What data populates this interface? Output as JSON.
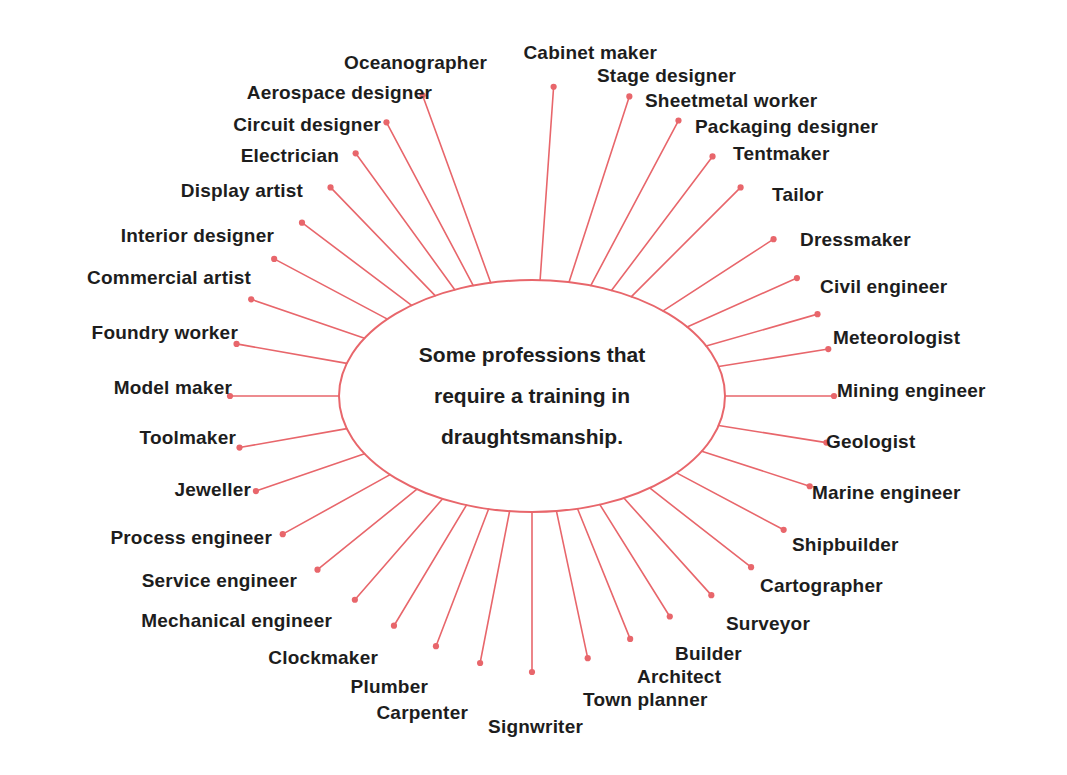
{
  "diagram": {
    "type": "radial-spoke-diagram",
    "title_lines": [
      "Some professions that",
      "require a training in",
      "draughtsmanship."
    ],
    "center_label": "Some professions that require a training in draughtsmanship.",
    "colors": {
      "spoke": "#e8666b",
      "ellipse": "#e8666b",
      "dot": "#e8666b",
      "text": "#1d1d1d",
      "background": "#ffffff"
    },
    "ellipse": {
      "cx": 532,
      "cy": 396,
      "rx": 193,
      "ry": 116
    },
    "spoke_count": 32,
    "nodes": [
      {
        "label": "Cabinet maker",
        "angle": -86,
        "r": 310,
        "side": "left",
        "lx": 657,
        "ly": 52
      },
      {
        "label": "Stage designer",
        "angle": -72,
        "r": 315,
        "side": "right",
        "lx": 597,
        "ly": 75
      },
      {
        "label": "Sheetmetal worker",
        "angle": -62,
        "r": 312,
        "side": "right",
        "lx": 645,
        "ly": 100
      },
      {
        "label": "Packaging designer",
        "angle": -53,
        "r": 300,
        "side": "right",
        "lx": 695,
        "ly": 126
      },
      {
        "label": "Tentmaker",
        "angle": -45,
        "r": 295,
        "side": "right",
        "lx": 733,
        "ly": 153
      },
      {
        "label": "Tailor",
        "angle": -33,
        "r": 288,
        "side": "right",
        "lx": 772,
        "ly": 194
      },
      {
        "label": "Dressmaker",
        "angle": -24,
        "r": 290,
        "side": "right",
        "lx": 800,
        "ly": 239
      },
      {
        "label": "Civil engineer",
        "angle": -16,
        "r": 297,
        "side": "right",
        "lx": 820,
        "ly": 286
      },
      {
        "label": "Meteorologist",
        "angle": -9,
        "r": 300,
        "side": "right",
        "lx": 833,
        "ly": 337
      },
      {
        "label": "Mining engineer",
        "angle": 0,
        "r": 302,
        "side": "right",
        "lx": 837,
        "ly": 390
      },
      {
        "label": "Geologist",
        "angle": 9,
        "r": 298,
        "side": "right",
        "lx": 826,
        "ly": 441
      },
      {
        "label": "Marine engineer",
        "angle": 18,
        "r": 292,
        "side": "right",
        "lx": 812,
        "ly": 492
      },
      {
        "label": "Shipbuilder",
        "angle": 28,
        "r": 285,
        "side": "right",
        "lx": 792,
        "ly": 544
      },
      {
        "label": "Cartographer",
        "angle": 38,
        "r": 278,
        "side": "right",
        "lx": 760,
        "ly": 585
      },
      {
        "label": "Surveyor",
        "angle": 48,
        "r": 268,
        "side": "right",
        "lx": 726,
        "ly": 623
      },
      {
        "label": "Builder",
        "angle": 58,
        "r": 260,
        "side": "right",
        "lx": 675,
        "ly": 653
      },
      {
        "label": "Architect",
        "angle": 68,
        "r": 262,
        "side": "right",
        "lx": 637,
        "ly": 676
      },
      {
        "label": "Town planner",
        "angle": 78,
        "r": 268,
        "side": "right",
        "lx": 583,
        "ly": 699
      },
      {
        "label": "Signwriter",
        "angle": 90,
        "r": 276,
        "side": "left",
        "lx": 583,
        "ly": 726
      },
      {
        "label": "Carpenter",
        "angle": 101,
        "r": 272,
        "side": "left",
        "lx": 468,
        "ly": 712
      },
      {
        "label": "Plumber",
        "angle": 111,
        "r": 268,
        "side": "left",
        "lx": 428,
        "ly": 686
      },
      {
        "label": "Clockmaker",
        "angle": 121,
        "r": 268,
        "side": "left",
        "lx": 378,
        "ly": 657
      },
      {
        "label": "Mechanical engineer",
        "angle": 131,
        "r": 270,
        "side": "left",
        "lx": 332,
        "ly": 620
      },
      {
        "label": "Service engineer",
        "angle": 141,
        "r": 276,
        "side": "left",
        "lx": 297,
        "ly": 580
      },
      {
        "label": "Process engineer",
        "angle": 151,
        "r": 285,
        "side": "left",
        "lx": 272,
        "ly": 537
      },
      {
        "label": "Jeweller",
        "angle": 161,
        "r": 292,
        "side": "left",
        "lx": 251,
        "ly": 489
      },
      {
        "label": "Toolmaker",
        "angle": 170,
        "r": 297,
        "side": "left",
        "lx": 236,
        "ly": 437
      },
      {
        "label": "Model maker",
        "angle": 180,
        "r": 302,
        "side": "left",
        "lx": 232,
        "ly": 387
      },
      {
        "label": "Foundry worker",
        "angle": 190,
        "r": 300,
        "side": "left",
        "lx": 238,
        "ly": 332
      },
      {
        "label": "Commercial artist",
        "angle": 199,
        "r": 297,
        "side": "left",
        "lx": 251,
        "ly": 277
      },
      {
        "label": "Interior designer",
        "angle": 208,
        "r": 292,
        "side": "left",
        "lx": 274,
        "ly": 235
      },
      {
        "label": "Display artist",
        "angle": 217,
        "r": 288,
        "side": "left",
        "lx": 303,
        "ly": 190
      },
      {
        "label": "Electrician",
        "angle": 226,
        "r": 290,
        "side": "left",
        "lx": 339,
        "ly": 155
      },
      {
        "label": "Circuit designer",
        "angle": 234,
        "r": 300,
        "side": "left",
        "lx": 381,
        "ly": 124
      },
      {
        "label": "Aerospace designer",
        "angle": 242,
        "r": 310,
        "side": "left",
        "lx": 432,
        "ly": 92
      },
      {
        "label": "Oceanographer",
        "angle": 250,
        "r": 320,
        "side": "left",
        "lx": 487,
        "ly": 62
      }
    ]
  }
}
